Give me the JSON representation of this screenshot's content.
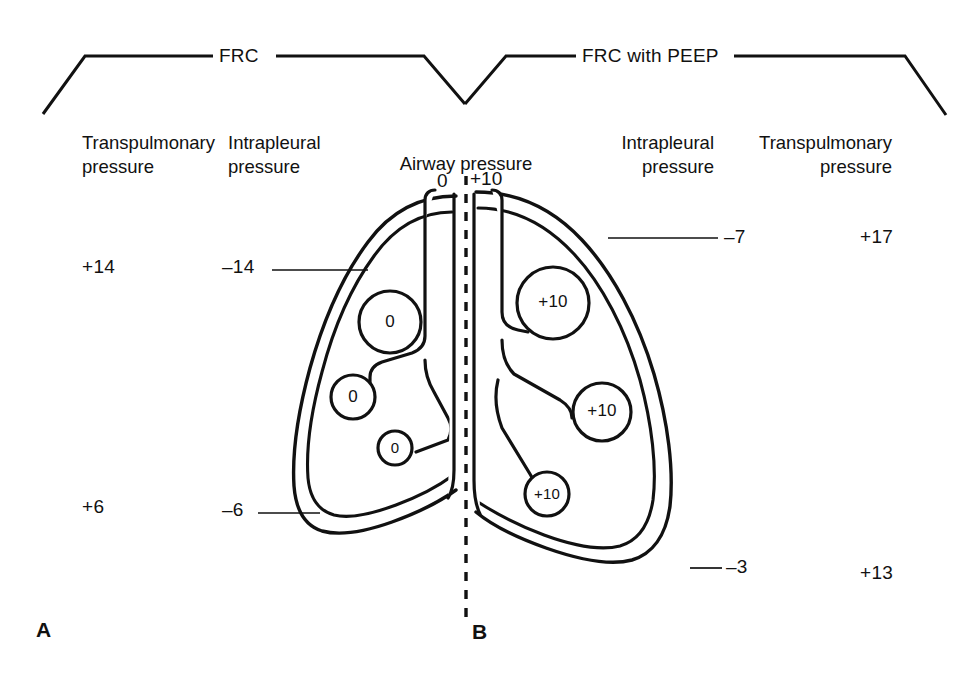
{
  "figure": {
    "background_color": "#ffffff",
    "ink_color": "#111111"
  },
  "brackets": [
    {
      "id": "frc",
      "label": "FRC"
    },
    {
      "id": "frc_peep",
      "label": "FRC with PEEP"
    }
  ],
  "column_headings": [
    {
      "id": "left-transpulmonary",
      "line1": "Transpulmonary",
      "line2": "pressure"
    },
    {
      "id": "left-intrapleural",
      "line1": "Intrapleural",
      "line2": "pressure"
    },
    {
      "id": "airway",
      "line1": "Airway pressure",
      "line2": ""
    },
    {
      "id": "right-intrapleural",
      "line1": "Intrapleural",
      "line2": "pressure"
    },
    {
      "id": "right-transpulmonary",
      "line1": "Transpulmonary",
      "line2": "pressure"
    }
  ],
  "airway_pressures": [
    {
      "id": "airway-left",
      "value": "0"
    },
    {
      "id": "airway-right",
      "value": "+10"
    }
  ],
  "panel_a": {
    "letter": "A",
    "transpulmonary": [
      {
        "id": "a-transpulmonary-apex",
        "value": "+14"
      },
      {
        "id": "a-transpulmonary-base",
        "value": "+6"
      }
    ],
    "intrapleural": [
      {
        "id": "a-intrapleural-apex",
        "value": "–14"
      },
      {
        "id": "a-intrapleural-base",
        "value": "–6"
      }
    ],
    "alveoli": [
      {
        "id": "a-alveolus-upper",
        "value": "0"
      },
      {
        "id": "a-alveolus-middle",
        "value": "0"
      },
      {
        "id": "a-alveolus-lower",
        "value": "0"
      }
    ]
  },
  "panel_b": {
    "letter": "B",
    "transpulmonary": [
      {
        "id": "b-transpulmonary-apex",
        "value": "+17"
      },
      {
        "id": "b-transpulmonary-base",
        "value": "+13"
      }
    ],
    "intrapleural": [
      {
        "id": "b-intrapleural-apex",
        "value": "–7"
      },
      {
        "id": "b-intrapleural-base",
        "value": "–3"
      }
    ],
    "alveoli": [
      {
        "id": "b-alveolus-upper",
        "value": "+10"
      },
      {
        "id": "b-alveolus-middle",
        "value": "+10"
      },
      {
        "id": "b-alveolus-lower",
        "value": "+10"
      }
    ]
  }
}
